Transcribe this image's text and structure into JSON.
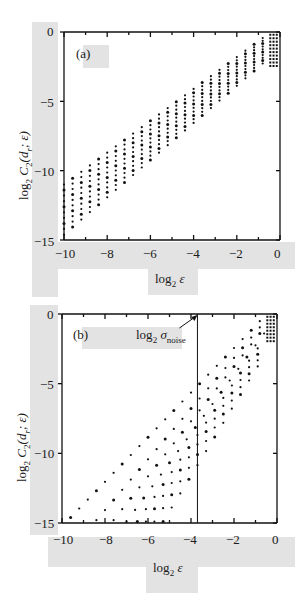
{
  "figure": {
    "panels": [
      {
        "tag": "(a)",
        "xlabel_prefix": "log",
        "xlabel_sub": "2",
        "xlabel_var": "ε",
        "ylabel_prefix": "log",
        "ylabel_sub": "2",
        "ylabel_main": " C",
        "ylabel_sub2": "2",
        "ylabel_args": "(d",
        "ylabel_sub3": "r",
        "ylabel_tail": "; ε)",
        "xticks": [
          "−10",
          "−8",
          "−6",
          "−4",
          "−2",
          "0"
        ],
        "yticks": [
          "0",
          "−5",
          "−10",
          "−15"
        ]
      },
      {
        "tag": "(b)",
        "xlabel_prefix": "log",
        "xlabel_sub": "2",
        "xlabel_var": "ε",
        "ylabel_prefix": "log",
        "ylabel_sub": "2",
        "ylabel_main": " C",
        "ylabel_sub2": "2",
        "ylabel_args": "(d",
        "ylabel_sub3": "r",
        "ylabel_tail": "; ε)",
        "xticks": [
          "−10",
          "−8",
          "−6",
          "−4",
          "−2",
          "0"
        ],
        "yticks": [
          "0",
          "−5",
          "−10",
          "−15"
        ],
        "annotation_prefix": "log",
        "annotation_sub": "2",
        "annotation_sigma": " σ",
        "annotation_sub2": "noise"
      }
    ]
  },
  "chart_data": [
    {
      "type": "scatter",
      "title": "(a)",
      "xlabel": "log2 ε",
      "ylabel": "log2 C2(d_r; ε)",
      "xlim": [
        -10,
        0
      ],
      "ylim": [
        -15,
        0
      ],
      "xticks": [
        -10,
        -8,
        -6,
        -4,
        -2,
        0
      ],
      "yticks": [
        0,
        -5,
        -10,
        -15
      ],
      "grid": false,
      "description": "Family of ~10 parallel correlation-sum curves (embedding dims) sampled at discrete ε; nearly linear with slope ~1.1, all converging toward (0,0) at the upper right.",
      "series_lines": [
        {
          "x_start": -10,
          "y_start": -11.0,
          "x_end": -0.6,
          "y_end": -0.2
        },
        {
          "x_start": -10,
          "y_start": -11.4,
          "x_end": -0.6,
          "y_end": -0.4
        },
        {
          "x_start": -10,
          "y_start": -11.8,
          "x_end": -0.6,
          "y_end": -0.6
        },
        {
          "x_start": -10,
          "y_start": -12.2,
          "x_end": -0.6,
          "y_end": -0.8
        },
        {
          "x_start": -10,
          "y_start": -12.6,
          "x_end": -0.6,
          "y_end": -1.0
        },
        {
          "x_start": -10,
          "y_start": -13.0,
          "x_end": -0.6,
          "y_end": -1.2
        },
        {
          "x_start": -10,
          "y_start": -13.4,
          "x_end": -0.6,
          "y_end": -1.4
        },
        {
          "x_start": -10,
          "y_start": -13.8,
          "x_end": -0.6,
          "y_end": -1.6
        },
        {
          "x_start": -10,
          "y_start": -14.2,
          "x_end": -0.6,
          "y_end": -1.8
        },
        {
          "x_start": -10,
          "y_start": -14.6,
          "x_end": -0.6,
          "y_end": -2.0
        }
      ]
    },
    {
      "type": "scatter",
      "title": "(b)",
      "xlabel": "log2 ε",
      "ylabel": "log2 C2(d_r; ε)",
      "xlim": [
        -10,
        0
      ],
      "ylim": [
        -15,
        0
      ],
      "xticks": [
        -10,
        -8,
        -6,
        -4,
        -2,
        0
      ],
      "yticks": [
        0,
        -5,
        -10,
        -15
      ],
      "grid": false,
      "annotations": [
        {
          "text": "log2 σnoise",
          "x": -3.7,
          "y": 0,
          "arrow": true
        }
      ],
      "vlines": [
        {
          "x": -3.7,
          "label": "log2 σnoise"
        }
      ],
      "description": "Same correlation sums with added noise; curves fan out with increasing slope below the noise level (ε < σnoise ≈ 2^-3.7).",
      "series_lines": [
        {
          "x_start": -9.6,
          "y_start": -14.6,
          "x_end": -0.6,
          "y_end": -0.2
        },
        {
          "x_start": -8.4,
          "y_start": -14.8,
          "x_end": -0.6,
          "y_end": -0.6
        },
        {
          "x_start": -7.6,
          "y_start": -14.8,
          "x_end": -0.6,
          "y_end": -1.0
        },
        {
          "x_start": -7.0,
          "y_start": -14.9,
          "x_end": -0.6,
          "y_end": -1.4
        },
        {
          "x_start": -6.5,
          "y_start": -14.9,
          "x_end": -0.6,
          "y_end": -1.8
        },
        {
          "x_start": -6.1,
          "y_start": -14.9,
          "x_end": -0.6,
          "y_end": -2.2
        },
        {
          "x_start": -5.7,
          "y_start": -14.9,
          "x_end": -0.6,
          "y_end": -2.6
        },
        {
          "x_start": -5.3,
          "y_start": -14.9,
          "x_end": -0.6,
          "y_end": -3.0
        }
      ]
    }
  ]
}
